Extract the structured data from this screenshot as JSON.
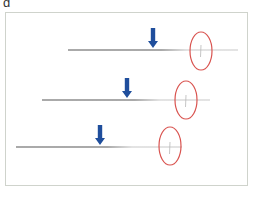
{
  "figure": {
    "panel_label": "d",
    "colors": {
      "line": "#555555",
      "line_fade": "#c8c8c8",
      "arrow": "#1f4e9c",
      "circle": "#d9534f",
      "border": "#cfd3cc"
    },
    "rows": [
      {
        "line": {
          "x1": 68,
          "x2": 238,
          "y": 50
        },
        "arrow": {
          "x": 153,
          "top": 28,
          "tip": 48
        },
        "circle": {
          "cx": 201,
          "cy": 51,
          "rx": 11,
          "ry": 19
        },
        "tick_x": 201
      },
      {
        "line": {
          "x1": 42,
          "x2": 210,
          "y": 100
        },
        "arrow": {
          "x": 127,
          "top": 78,
          "tip": 98
        },
        "circle": {
          "cx": 186,
          "cy": 100,
          "rx": 11,
          "ry": 19
        },
        "tick_x": 186
      },
      {
        "line": {
          "x1": 16,
          "x2": 182,
          "y": 147
        },
        "arrow": {
          "x": 100,
          "top": 125,
          "tip": 145
        },
        "circle": {
          "cx": 170,
          "cy": 146,
          "rx": 11,
          "ry": 19
        },
        "tick_x": 170
      }
    ]
  }
}
